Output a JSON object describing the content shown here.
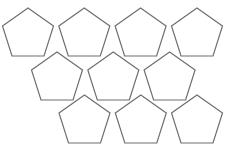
{
  "diagram": {
    "title": "",
    "shape": "pentagon",
    "stroke_color": "#6e6e6e",
    "fill_color": "#ffffff",
    "stroke_width": 1.2,
    "count": 10,
    "rows": [
      {
        "row": 1,
        "count": 4,
        "apex_y": 8,
        "apex_x": [
          28,
          84.3,
          140.6,
          197
        ]
      },
      {
        "row": 2,
        "count": 3,
        "apex_y": 52,
        "apex_x": [
          57,
          113.3,
          169.6
        ]
      },
      {
        "row": 3,
        "count": 3,
        "apex_y": 95,
        "apex_x": [
          84.5,
          140.8,
          197
        ]
      }
    ],
    "pentagon_geometry": {
      "half_width": 25.5,
      "shoulder_dy": 18,
      "base_half_width": 16,
      "base_dy": 48
    }
  }
}
